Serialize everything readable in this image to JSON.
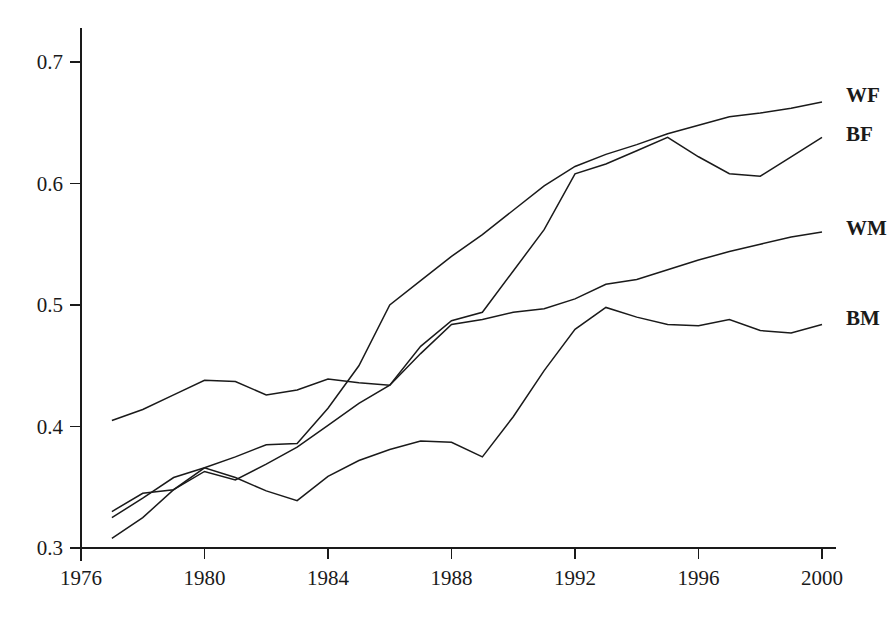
{
  "chart_data": {
    "type": "line",
    "title": "",
    "xlabel": "",
    "ylabel": "",
    "xlim": [
      1976,
      2000.6
    ],
    "ylim": [
      0.3,
      0.71
    ],
    "grid": false,
    "legend_position": "right-inline-labels",
    "x_ticks": [
      1976,
      1980,
      1984,
      1988,
      1992,
      1996,
      2000
    ],
    "x_tick_labels": [
      "1976",
      "1980",
      "1984",
      "1988",
      "1992",
      "1996",
      "2000"
    ],
    "y_ticks": [
      0.3,
      0.4,
      0.5,
      0.6,
      0.7
    ],
    "y_tick_labels": [
      "0.3",
      "0.4",
      "0.5",
      "0.6",
      "0.7"
    ],
    "x": [
      1977,
      1978,
      1979,
      1980,
      1981,
      1982,
      1983,
      1984,
      1985,
      1986,
      1987,
      1988,
      1989,
      1990,
      1991,
      1992,
      1993,
      1994,
      1995,
      1996,
      1997,
      1998,
      1999,
      2000
    ],
    "series": [
      {
        "name": "WF",
        "label": "WF",
        "label_y_value": 0.673,
        "values": [
          0.325,
          0.341,
          0.358,
          0.366,
          0.375,
          0.385,
          0.386,
          0.415,
          0.45,
          0.5,
          0.52,
          0.54,
          0.558,
          0.578,
          0.598,
          0.614,
          0.624,
          0.632,
          0.641,
          0.648,
          0.655,
          0.658,
          0.662,
          0.667
        ]
      },
      {
        "name": "BF",
        "label": "BF",
        "label_y_value": 0.641,
        "values": [
          0.308,
          0.325,
          0.348,
          0.363,
          0.356,
          0.369,
          0.383,
          0.401,
          0.419,
          0.434,
          0.466,
          0.487,
          0.494,
          0.528,
          0.562,
          0.608,
          0.616,
          0.627,
          0.638,
          0.622,
          0.608,
          0.606,
          0.622,
          0.638
        ]
      },
      {
        "name": "WM",
        "label": "WM",
        "label_y_value": 0.563,
        "values": [
          0.405,
          0.414,
          0.426,
          0.438,
          0.437,
          0.426,
          0.43,
          0.439,
          0.436,
          0.434,
          0.46,
          0.484,
          0.488,
          0.494,
          0.497,
          0.505,
          0.517,
          0.521,
          0.529,
          0.537,
          0.544,
          0.55,
          0.556,
          0.56
        ]
      },
      {
        "name": "BM",
        "label": "BM",
        "label_y_value": 0.489,
        "values": [
          0.33,
          0.345,
          0.348,
          0.366,
          0.358,
          0.347,
          0.339,
          0.359,
          0.372,
          0.381,
          0.388,
          0.387,
          0.375,
          0.408,
          0.446,
          0.48,
          0.498,
          0.49,
          0.484,
          0.483,
          0.488,
          0.479,
          0.477,
          0.484
        ]
      }
    ]
  },
  "axes": {
    "y_axis_name": "value-axis",
    "x_axis_name": "year-axis"
  }
}
